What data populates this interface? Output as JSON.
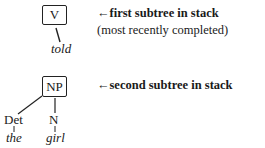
{
  "stack": [
    {
      "root": "V",
      "children": [
        {
          "label": "",
          "word": "told"
        }
      ],
      "annotation": {
        "arrow": "←",
        "bold_text": "first subtree in stack",
        "sub_text": "(most recently completed)"
      }
    },
    {
      "root": "NP",
      "children": [
        {
          "label": "Det",
          "word": "the"
        },
        {
          "label": "N",
          "word": "girl"
        }
      ],
      "annotation": {
        "arrow": "←",
        "bold_text": "second subtree in stack",
        "sub_text": ""
      }
    }
  ]
}
